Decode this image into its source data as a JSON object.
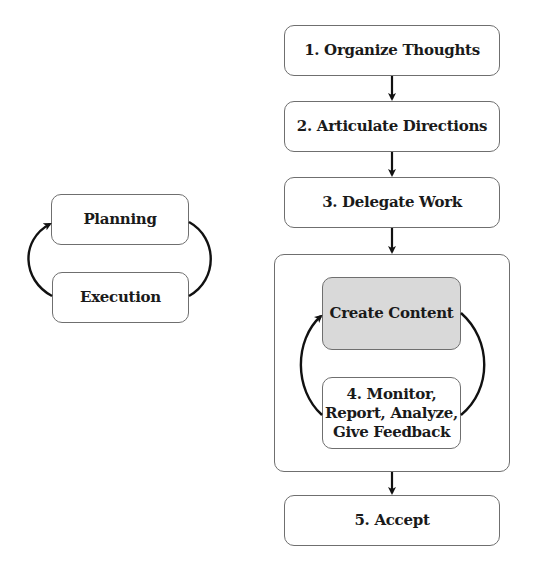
{
  "left_cycle": {
    "planning": "Planning",
    "execution": "Execution"
  },
  "steps": {
    "step1": "1. Organize Thoughts",
    "step2": "2. Articulate Directions",
    "step3": "3. Delegate Work",
    "create_content": "Create Content",
    "step4": "4. Monitor,\nReport, Analyze,\nGive Feedback",
    "step5": "5. Accept"
  },
  "colors": {
    "box_border": "#6f6f6f",
    "highlight_fill": "#d9d9d9",
    "arrow": "#111111"
  }
}
